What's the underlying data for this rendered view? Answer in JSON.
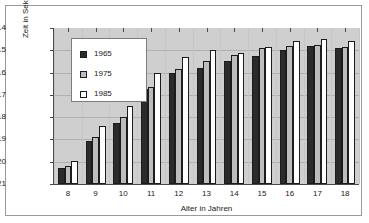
{
  "figure": {
    "y_axis_title": "Zeit in Sekunden",
    "x_axis_title": "Alter in Jahren"
  },
  "legend": {
    "position": "top-left",
    "entries": [
      {
        "label": "1965",
        "color": "#2b2b2b",
        "swatch_name": "legend-swatch-1965"
      },
      {
        "label": "1975",
        "color": "#bdbdbd",
        "swatch_name": "legend-swatch-1975"
      },
      {
        "label": "1985",
        "color": "#ffffff",
        "swatch_name": "legend-swatch-1985"
      }
    ]
  },
  "chart_data": {
    "type": "bar",
    "title": "",
    "subtitle": "",
    "xlabel": "Alter in Jahren",
    "ylabel": "Zeit in Sekunden",
    "categories": [
      "8",
      "9",
      "10",
      "11",
      "12",
      "13",
      "14",
      "15",
      "16",
      "17",
      "18"
    ],
    "ylim": [
      14,
      21
    ],
    "y_inverted": true,
    "yticks": [
      "14",
      "15",
      "16",
      "17",
      "18",
      "19",
      "20",
      "21"
    ],
    "grid": true,
    "legend_position": "top-left",
    "series": [
      {
        "name": "1965",
        "color": "#2b2b2b",
        "values": [
          20.3,
          19.05,
          18.25,
          16.75,
          16.0,
          15.8,
          15.5,
          15.25,
          15.0,
          14.8,
          14.9
        ]
      },
      {
        "name": "1975",
        "color": "#bdbdbd",
        "values": [
          20.2,
          18.9,
          18.0,
          16.65,
          15.85,
          15.5,
          15.2,
          14.9,
          14.8,
          14.75,
          14.85
        ]
      },
      {
        "name": "1985",
        "color": "#ffffff",
        "values": [
          19.95,
          18.4,
          17.5,
          16.0,
          15.3,
          15.0,
          15.1,
          14.85,
          14.6,
          14.5,
          14.6
        ]
      }
    ]
  }
}
